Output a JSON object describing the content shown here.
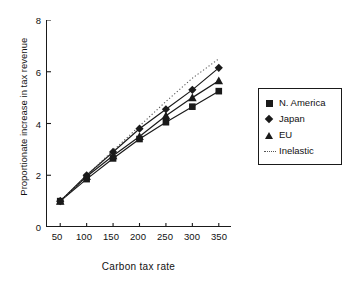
{
  "chart_data": {
    "type": "line",
    "title": "",
    "xlabel": "Carbon tax rate",
    "ylabel": "Proportionate increase in tax revenue",
    "x": [
      50,
      100,
      150,
      200,
      250,
      300,
      350
    ],
    "xlim": [
      25,
      375
    ],
    "ylim": [
      0,
      8
    ],
    "xticks": [
      "50",
      "100",
      "150",
      "200",
      "250",
      "300",
      "350"
    ],
    "yticks": [
      "0",
      "2",
      "4",
      "6",
      "8"
    ],
    "grid": false,
    "legend_position": "right",
    "series": [
      {
        "name": "N. America",
        "marker": "square",
        "linestyle": "solid",
        "color": "#1a1a1a",
        "values": [
          1.0,
          1.85,
          2.65,
          3.4,
          4.05,
          4.65,
          5.25
        ]
      },
      {
        "name": "Japan",
        "marker": "diamond",
        "linestyle": "solid",
        "color": "#1a1a1a",
        "values": [
          1.0,
          2.0,
          2.9,
          3.8,
          4.55,
          5.3,
          6.15
        ]
      },
      {
        "name": "EU",
        "marker": "triangle",
        "linestyle": "solid",
        "color": "#1a1a1a",
        "values": [
          1.0,
          1.95,
          2.75,
          3.5,
          4.3,
          5.0,
          5.65
        ]
      },
      {
        "name": "Inelastic",
        "marker": "none",
        "linestyle": "dotted",
        "color": "#555555",
        "values": [
          1.0,
          2.0,
          2.95,
          3.9,
          4.85,
          5.75,
          6.5
        ]
      }
    ]
  },
  "legend": {
    "items": [
      {
        "label": "N. America",
        "key": "square-marker-key"
      },
      {
        "label": "Japan",
        "key": "diamond-marker-key"
      },
      {
        "label": "EU",
        "key": "triangle-marker-key"
      },
      {
        "label": "Inelastic",
        "key": "dotted-line-key"
      }
    ]
  },
  "axes": {
    "x_title": "Carbon tax rate",
    "y_title": "Proportionate increase in tax revenue",
    "x_ticks": [
      "50",
      "100",
      "150",
      "200",
      "250",
      "300",
      "350"
    ],
    "y_ticks": [
      "0",
      "2",
      "4",
      "6",
      "8"
    ]
  }
}
